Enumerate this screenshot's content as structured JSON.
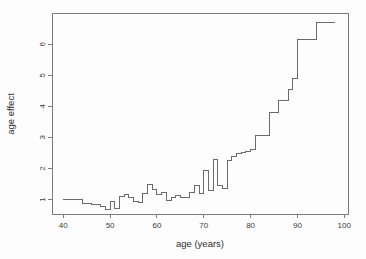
{
  "figure": {
    "kind": "r-style-statistical-plot"
  },
  "chart_data": {
    "type": "line",
    "subtype": "step",
    "title": "",
    "xlabel": "age (years)",
    "ylabel": "age effect",
    "x_ticks": [
      40,
      50,
      60,
      70,
      80,
      90,
      100
    ],
    "y_ticks": [
      1,
      2,
      3,
      4,
      5,
      6
    ],
    "xlim": [
      37.6,
      100.8
    ],
    "ylim": [
      0.53,
      7.01
    ],
    "grid": false,
    "legend_position": "none",
    "series": [
      {
        "name": "age effect",
        "step_start_ages": [
          40,
          44,
          46,
          48,
          49,
          50,
          51,
          52,
          53,
          54,
          55,
          56,
          57,
          58,
          59,
          60,
          61,
          62,
          63,
          64,
          65,
          67,
          68,
          69,
          70,
          71,
          72,
          73,
          74,
          75,
          76,
          77,
          78,
          79,
          80,
          81,
          84,
          86,
          88,
          89,
          90,
          94
        ],
        "step_values": [
          1.0,
          0.88,
          0.84,
          0.78,
          0.68,
          0.95,
          0.7,
          1.08,
          1.15,
          1.06,
          0.95,
          0.9,
          1.18,
          1.48,
          1.32,
          1.16,
          1.24,
          0.98,
          1.05,
          1.12,
          1.05,
          1.22,
          1.45,
          1.2,
          1.95,
          1.3,
          2.3,
          1.45,
          1.35,
          2.25,
          2.4,
          2.48,
          2.52,
          2.56,
          2.6,
          3.05,
          3.8,
          4.2,
          4.55,
          4.9,
          6.15,
          6.7
        ],
        "end_age": 98
      }
    ]
  },
  "colors": {
    "background": "#fdfdfd",
    "plot_box": "#7c7c7c",
    "step_line": "#6b6b6b",
    "tick_color": "#7c7c7c",
    "tick_text": "#3c3c3c",
    "label_text": "#2e2e2e"
  }
}
